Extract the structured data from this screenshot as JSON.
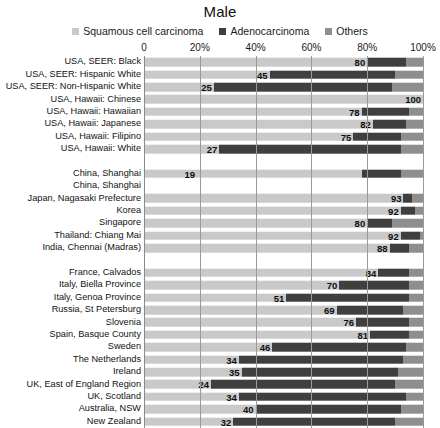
{
  "chart_data": {
    "type": "bar",
    "subtype": "stacked-horizontal-100pct",
    "title": "Male",
    "xlabel": "",
    "ylabel": "",
    "xlim": [
      0,
      100
    ],
    "grid": true,
    "legend_position": "top-center",
    "xticks": [
      {
        "value": 0,
        "label": "0"
      },
      {
        "value": 20,
        "label": "20%"
      },
      {
        "value": 40,
        "label": "40%"
      },
      {
        "value": 60,
        "label": "60%"
      },
      {
        "value": 80,
        "label": "80%"
      },
      {
        "value": 100,
        "label": "100%"
      }
    ],
    "series": [
      {
        "name": "Squamous cell carcinoma",
        "color": "#c9c9c9"
      },
      {
        "name": "Adenocarcinoma",
        "color": "#3f3f3f"
      },
      {
        "name": "Others",
        "color": "#8e8e8e"
      }
    ],
    "categories": [
      "USA, SEER: Black",
      "USA, SEER: Hispanic White",
      "USA, SEER: Non-Hispanic White",
      "USA, Hawaii: Chinese",
      "USA, Hawaii: Hawaiian",
      "USA, Hawaii: Japanese",
      "USA, Hawaii: Filipino",
      "USA, Hawaii: White",
      "",
      "China, Shanghai",
      "China, Shanghai",
      "Japan, Nagasaki Prefecture",
      "Korea",
      "Singapore",
      "Thailand: Chiang Mai",
      "India, Chennai (Madras)",
      "",
      "France, Calvados",
      "Italy, Biella Province",
      "Italy, Genoa Province",
      "Russia, St Petersburg",
      "Slovenia",
      "Spain, Basque County",
      "Sweden",
      "The Netherlands",
      "Ireland",
      "UK, East of England Region",
      "UK, Scotland",
      "Australia, NSW",
      "New Zealand"
    ],
    "rows": [
      {
        "label": "USA, SEER: Black",
        "squamous": 80,
        "adeno": 14,
        "others": 6,
        "data_label": "80"
      },
      {
        "label": "USA, SEER: Hispanic White",
        "squamous": 45,
        "adeno": 45,
        "others": 10,
        "data_label": "45"
      },
      {
        "label": "USA, SEER: Non-Hispanic White",
        "squamous": 25,
        "adeno": 64,
        "others": 11,
        "data_label": "25"
      },
      {
        "label": "USA, Hawaii: Chinese",
        "squamous": 100,
        "adeno": 0,
        "others": 0,
        "data_label": "100"
      },
      {
        "label": "USA, Hawaii: Hawaiian",
        "squamous": 78,
        "adeno": 17,
        "others": 5,
        "data_label": "78"
      },
      {
        "label": "USA, Hawaii: Japanese",
        "squamous": 82,
        "adeno": 12,
        "others": 6,
        "data_label": "82"
      },
      {
        "label": "USA, Hawaii: Filipino",
        "squamous": 75,
        "adeno": 17,
        "others": 8,
        "data_label": "75"
      },
      {
        "label": "USA, Hawaii: White",
        "squamous": 27,
        "adeno": 65,
        "others": 8,
        "data_label": "27"
      },
      {
        "label": "",
        "squamous": 0,
        "adeno": 0,
        "others": 0,
        "data_label": "",
        "blank": true
      },
      {
        "label": "China, Shanghai",
        "squamous": 19,
        "adeno": 14,
        "others": 8,
        "data_label": "19",
        "squamous_extent": 78
      },
      {
        "label": "China, Shanghai",
        "squamous": 0,
        "adeno": 0,
        "others": 0,
        "data_label": "",
        "blank": true
      },
      {
        "label": "Japan, Nagasaki Prefecture",
        "squamous": 93,
        "adeno": 3,
        "others": 4,
        "data_label": "93"
      },
      {
        "label": "Korea",
        "squamous": 92,
        "adeno": 5,
        "others": 3,
        "data_label": "92"
      },
      {
        "label": "Singapore",
        "squamous": 80,
        "adeno": 9,
        "others": 11,
        "data_label": "80"
      },
      {
        "label": "Thailand: Chiang Mai",
        "squamous": 92,
        "adeno": 7,
        "others": 1,
        "data_label": "92"
      },
      {
        "label": "India, Chennai (Madras)",
        "squamous": 88,
        "adeno": 7,
        "others": 5,
        "data_label": "88"
      },
      {
        "label": "",
        "squamous": 0,
        "adeno": 0,
        "others": 0,
        "data_label": "",
        "blank": true
      },
      {
        "label": "France, Calvados",
        "squamous": 84,
        "adeno": 11,
        "others": 5,
        "data_label": "84"
      },
      {
        "label": "Italy, Biella Province",
        "squamous": 70,
        "adeno": 25,
        "others": 5,
        "data_label": "70"
      },
      {
        "label": "Italy, Genoa Province",
        "squamous": 51,
        "adeno": 44,
        "others": 5,
        "data_label": "51"
      },
      {
        "label": "Russia, St Petersburg",
        "squamous": 69,
        "adeno": 24,
        "others": 7,
        "data_label": "69"
      },
      {
        "label": "Slovenia",
        "squamous": 76,
        "adeno": 19,
        "others": 5,
        "data_label": "76"
      },
      {
        "label": "Spain, Basque County",
        "squamous": 81,
        "adeno": 14,
        "others": 5,
        "data_label": "81"
      },
      {
        "label": "Sweden",
        "squamous": 46,
        "adeno": 48,
        "others": 6,
        "data_label": "46"
      },
      {
        "label": "The Netherlands",
        "squamous": 34,
        "adeno": 59,
        "others": 7,
        "data_label": "34"
      },
      {
        "label": "Ireland",
        "squamous": 35,
        "adeno": 56,
        "others": 9,
        "data_label": "35"
      },
      {
        "label": "UK, East of England Region",
        "squamous": 24,
        "adeno": 66,
        "others": 10,
        "data_label": "24"
      },
      {
        "label": "UK, Scotland",
        "squamous": 34,
        "adeno": 60,
        "others": 6,
        "data_label": "34"
      },
      {
        "label": "Australia, NSW",
        "squamous": 40,
        "adeno": 52,
        "others": 8,
        "data_label": "40"
      },
      {
        "label": "New Zealand",
        "squamous": 32,
        "adeno": 58,
        "others": 10,
        "data_label": "32"
      }
    ]
  },
  "colors": {
    "squamous": "#c9c9c9",
    "adeno": "#3f3f3f",
    "others": "#8e8e8e",
    "gridline": "#9a9a9a",
    "text": "#111111"
  }
}
